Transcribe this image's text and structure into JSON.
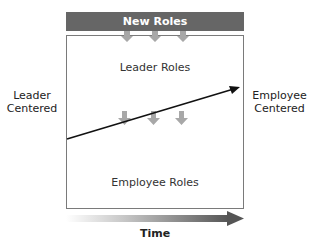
{
  "banner": {
    "label": "New Roles",
    "color": "#666666"
  },
  "labels": {
    "left": [
      "Leader",
      "Centered"
    ],
    "right": [
      "Employee",
      "Centered"
    ],
    "top_inner": "Leader Roles",
    "bottom_inner": "Employee Roles",
    "time": "Time"
  },
  "colors": {
    "arrow_gray": "#a8a8a8",
    "trend_line": "#111111",
    "box_border": "#7a7a7a"
  },
  "icons": {
    "top_arrows": [
      "down-arrow-icon",
      "down-arrow-icon",
      "down-arrow-icon"
    ],
    "middle_arrows": [
      "down-arrow-icon",
      "down-arrow-icon",
      "down-arrow-icon"
    ],
    "trend": "trend-arrow-icon",
    "time": "time-arrow-icon"
  }
}
